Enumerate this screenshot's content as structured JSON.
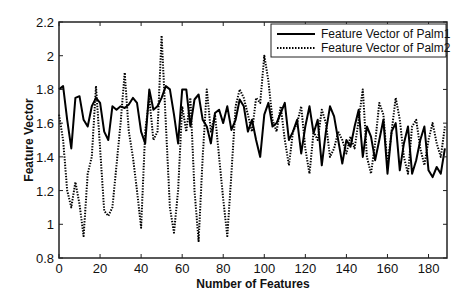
{
  "chart_data": {
    "type": "line",
    "title": "",
    "xlabel": "Number of Features",
    "ylabel": "Feature Vector",
    "xlim": [
      0,
      189
    ],
    "ylim": [
      0.8,
      2.2
    ],
    "xticks": [
      0,
      20,
      40,
      60,
      80,
      100,
      120,
      140,
      160,
      180
    ],
    "yticks": [
      0.8,
      1,
      1.2,
      1.4,
      1.6,
      1.8,
      2,
      2.2
    ],
    "xtick_labels": [
      "0",
      "20",
      "40",
      "60",
      "80",
      "100",
      "120",
      "140",
      "160",
      "180"
    ],
    "ytick_labels": [
      "0.8",
      "1",
      "1.2",
      "1.4",
      "1.6",
      "1.8",
      "2",
      "2.2"
    ],
    "grid": false,
    "legend_position": "upper right",
    "series": [
      {
        "name": "Feature Vector of Palm1",
        "style": "solid",
        "color": "#000000",
        "x": [
          0,
          2,
          4,
          6,
          8,
          10,
          12,
          14,
          16,
          18,
          20,
          22,
          24,
          26,
          28,
          30,
          32,
          34,
          36,
          38,
          40,
          42,
          44,
          46,
          48,
          50,
          52,
          54,
          56,
          58,
          60,
          62,
          64,
          66,
          68,
          70,
          72,
          74,
          76,
          78,
          80,
          82,
          84,
          86,
          88,
          90,
          92,
          94,
          96,
          98,
          100,
          102,
          104,
          106,
          108,
          110,
          112,
          114,
          116,
          118,
          120,
          122,
          124,
          126,
          128,
          130,
          132,
          134,
          136,
          138,
          140,
          142,
          144,
          146,
          148,
          150,
          152,
          154,
          156,
          158,
          160,
          162,
          164,
          166,
          168,
          170,
          172,
          174,
          176,
          178,
          180,
          182,
          184,
          186,
          188
        ],
        "values": [
          1.8,
          1.82,
          1.62,
          1.45,
          1.75,
          1.76,
          1.62,
          1.58,
          1.7,
          1.75,
          1.72,
          1.55,
          1.5,
          1.7,
          1.68,
          1.7,
          1.69,
          1.71,
          1.75,
          1.72,
          1.55,
          1.48,
          1.8,
          1.68,
          1.7,
          1.75,
          1.82,
          1.8,
          1.65,
          1.48,
          1.8,
          1.8,
          1.58,
          1.74,
          1.77,
          1.62,
          1.58,
          1.48,
          1.66,
          1.68,
          1.6,
          1.7,
          1.56,
          1.62,
          1.74,
          1.7,
          1.55,
          1.62,
          1.5,
          1.4,
          1.65,
          1.72,
          1.58,
          1.6,
          1.66,
          1.72,
          1.5,
          1.55,
          1.62,
          1.42,
          1.58,
          1.7,
          1.54,
          1.62,
          1.35,
          1.55,
          1.7,
          1.64,
          1.5,
          1.36,
          1.5,
          1.46,
          1.58,
          1.68,
          1.4,
          1.58,
          1.52,
          1.38,
          1.5,
          1.62,
          1.3,
          1.55,
          1.6,
          1.32,
          1.48,
          1.58,
          1.3,
          1.38,
          1.5,
          1.58,
          1.32,
          1.28,
          1.34,
          1.3,
          1.45
        ]
      },
      {
        "name": "Feature Vector of Palm2",
        "style": "dotted",
        "color": "#000000",
        "x": [
          0,
          2,
          4,
          6,
          8,
          10,
          12,
          14,
          16,
          18,
          20,
          22,
          24,
          26,
          28,
          30,
          32,
          34,
          36,
          38,
          40,
          42,
          44,
          46,
          48,
          50,
          52,
          54,
          56,
          58,
          60,
          62,
          64,
          66,
          68,
          70,
          72,
          74,
          76,
          78,
          80,
          82,
          84,
          86,
          88,
          90,
          92,
          94,
          96,
          98,
          100,
          102,
          104,
          106,
          108,
          110,
          112,
          114,
          116,
          118,
          120,
          122,
          124,
          126,
          128,
          130,
          132,
          134,
          136,
          138,
          140,
          142,
          144,
          146,
          148,
          150,
          152,
          154,
          156,
          158,
          160,
          162,
          164,
          166,
          168,
          170,
          172,
          174,
          176,
          178,
          180,
          182,
          184,
          186,
          188
        ],
        "values": [
          1.65,
          1.5,
          1.2,
          1.1,
          1.25,
          1.12,
          0.93,
          1.3,
          1.4,
          1.82,
          1.45,
          1.08,
          1.05,
          1.1,
          1.35,
          1.6,
          1.9,
          1.55,
          1.4,
          1.2,
          0.98,
          1.55,
          1.75,
          1.5,
          1.55,
          2.12,
          1.6,
          1.1,
          0.95,
          1.2,
          1.7,
          1.55,
          1.75,
          1.2,
          0.9,
          1.4,
          1.8,
          1.55,
          1.65,
          1.4,
          1.15,
          0.93,
          1.3,
          1.7,
          1.8,
          1.75,
          1.65,
          1.55,
          1.75,
          1.72,
          2.0,
          1.85,
          1.62,
          1.55,
          1.7,
          1.5,
          1.35,
          1.55,
          1.6,
          1.7,
          1.45,
          1.3,
          1.55,
          1.5,
          1.68,
          1.6,
          1.4,
          1.45,
          1.55,
          1.5,
          1.42,
          1.52,
          1.45,
          1.62,
          1.8,
          1.4,
          1.3,
          1.48,
          1.72,
          1.65,
          1.35,
          1.55,
          1.75,
          1.62,
          1.4,
          1.3,
          1.58,
          1.62,
          1.45,
          1.35,
          1.5,
          1.6,
          1.48,
          1.4,
          1.58
        ]
      }
    ]
  },
  "layout": {
    "plot_left": 59,
    "plot_top": 22,
    "plot_right": 447,
    "plot_bottom": 258,
    "legend": {
      "x": 271,
      "y": 24,
      "w": 175,
      "h": 33
    }
  }
}
